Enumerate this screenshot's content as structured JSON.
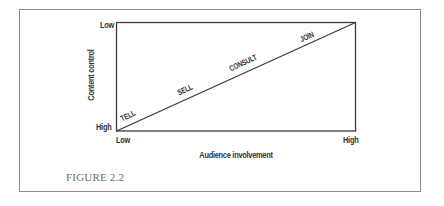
{
  "figure": {
    "caption": "FIGURE 2.2"
  },
  "diagram": {
    "type": "continuum-triangle",
    "y_axis": {
      "title": "Content control",
      "top_label": "Low",
      "bottom_label": "High"
    },
    "x_axis": {
      "title": "Audience involvement",
      "left_label": "Low",
      "right_label": "High"
    },
    "diagonal_labels": [
      "TELL",
      "SELL",
      "CONSULT",
      "JOIN"
    ],
    "colors": {
      "line": "#3a3a3a",
      "frame": "#8c8c8c",
      "text": "#333333",
      "caption": "#6a6a6a"
    }
  }
}
